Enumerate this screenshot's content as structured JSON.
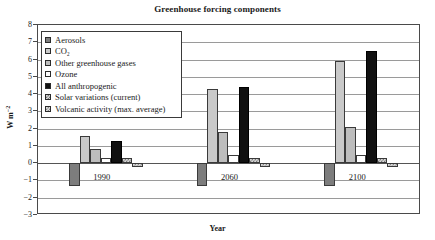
{
  "chart_data": {
    "type": "bar",
    "title": "Greenhouse forcing components",
    "xlabel": "Year",
    "ylabel": "W m-2",
    "ylabel_html": "W m<sup>−2</sup>",
    "categories": [
      "1990",
      "2060",
      "2100"
    ],
    "ylim": [
      -3,
      8
    ],
    "yticks": [
      8,
      7,
      6,
      5,
      4,
      3,
      2,
      1,
      0,
      -1,
      -2,
      -3
    ],
    "grid": true,
    "legend_position": "upper-left-inside",
    "series": [
      {
        "name": "Aerosols",
        "key": "aerosols",
        "color": "#7d7d7d",
        "fill": "solid",
        "values": [
          -1.3,
          -1.3,
          -1.3
        ]
      },
      {
        "name": "CO2",
        "key": "co2",
        "color": "#c9c9c9",
        "fill": "solid",
        "values": [
          1.6,
          4.3,
          5.9
        ]
      },
      {
        "name": "Other greenhouse gases",
        "key": "other",
        "color": "#bdbdbd",
        "fill": "solid",
        "values": [
          0.8,
          1.8,
          2.1
        ]
      },
      {
        "name": "Ozone",
        "key": "ozone",
        "color": "#ffffff",
        "fill": "solid",
        "values": [
          0.3,
          0.45,
          0.45
        ]
      },
      {
        "name": "All anthropogenic",
        "key": "anthro",
        "color": "#111111",
        "fill": "solid",
        "values": [
          1.3,
          4.4,
          6.5
        ]
      },
      {
        "name": "Solar variations (current)",
        "key": "solar",
        "color": "#d8d8d8",
        "fill": "hatch",
        "values": [
          0.3,
          0.3,
          0.3
        ]
      },
      {
        "name": "Volcanic activity (max. average)",
        "key": "volcanic",
        "color": "#dedede",
        "fill": "hatch",
        "values": [
          -0.2,
          -0.2,
          -0.2
        ]
      }
    ]
  },
  "legend": {
    "items": [
      {
        "label": "Aerosols"
      },
      {
        "label": "CO₂"
      },
      {
        "label": "Other greenhouse gases"
      },
      {
        "label": "Ozone"
      },
      {
        "label": "All anthropogenic"
      },
      {
        "label": "Solar variations (current)"
      },
      {
        "label": "Volcanic activity (max. average)"
      }
    ]
  }
}
